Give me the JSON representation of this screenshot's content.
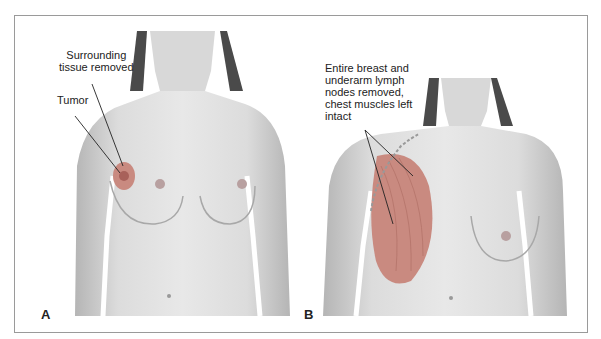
{
  "figure": {
    "panels": [
      {
        "letter": "A",
        "procedure_depicted": "lumpectomy",
        "labels": {
          "surrounding": [
            "Surrounding",
            "tissue removed"
          ],
          "tumor": "Tumor"
        }
      },
      {
        "letter": "B",
        "procedure_depicted": "modified radical mastectomy",
        "labels": {
          "removed": [
            "Entire breast and",
            "underarm lymph",
            "nodes removed,",
            "chest muscles left",
            "intact"
          ]
        }
      }
    ],
    "colors": {
      "skin": "#dedede",
      "skin_shadow": "#b8b8b8",
      "hair": "#4a4a4a",
      "excision": "#c98a80",
      "tumor": "#a8615a",
      "frame": "#9a9a9a"
    }
  }
}
